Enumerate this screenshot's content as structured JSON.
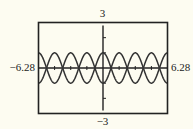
{
  "chart_data": {
    "type": "line",
    "title": "",
    "xlabel": "",
    "ylabel": "",
    "xlim": [
      -6.28,
      6.28
    ],
    "ylim": [
      -3,
      3
    ],
    "x_tick_labels": [
      "-6.28",
      "6.28"
    ],
    "y_tick_labels": [
      "3",
      "-3"
    ],
    "grid": false,
    "legend": null,
    "series": [
      {
        "name": "y = cos(2x)",
        "expression": "cos(2x)",
        "amplitude": 1,
        "frequency": 2,
        "sign": 1
      },
      {
        "name": "y = -cos(2x)",
        "expression": "-cos(2x)",
        "amplitude": 1,
        "frequency": 2,
        "sign": -1
      }
    ],
    "x_tick_step": 1.5708,
    "y_tick_step": 1,
    "colors": {
      "background": "#fdfcf1",
      "frame": "#222222",
      "curve": "#333333",
      "axis": "#222222"
    }
  },
  "labels": {
    "ymax": "3",
    "ymin": "−3",
    "xmin": "−6.28",
    "xmax": "6.28"
  }
}
